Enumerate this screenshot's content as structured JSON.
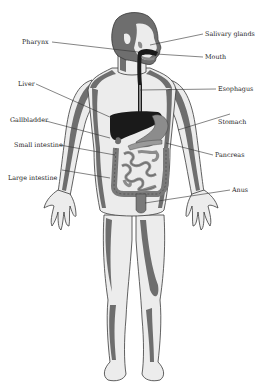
{
  "diagram": {
    "colors": {
      "background": "#ffffff",
      "skin_light": "#ececec",
      "skin_shade": "#6e6e6e",
      "outline": "#3a3a3a",
      "organ_dark": "#1a1a1a",
      "organ_gray": "#8c8c8c",
      "label_text": "#222222"
    },
    "labels": [
      {
        "id": "pharynx",
        "text": "Pharynx",
        "x": 22,
        "y": 44,
        "anchor": "start",
        "line": [
          52,
          42,
          138,
          52
        ]
      },
      {
        "id": "salivary-glands",
        "text": "Salivary glands",
        "x": 205,
        "y": 36,
        "anchor": "start",
        "line": [
          150,
          45,
          203,
          34
        ]
      },
      {
        "id": "mouth",
        "text": "Mouth",
        "x": 205,
        "y": 59,
        "anchor": "start",
        "line": [
          156,
          54,
          203,
          57
        ]
      },
      {
        "id": "liver",
        "text": "Liver",
        "x": 18,
        "y": 86,
        "anchor": "start",
        "line": [
          36,
          84,
          112,
          118
        ]
      },
      {
        "id": "esophagus",
        "text": "Esophagus",
        "x": 218,
        "y": 91,
        "anchor": "start",
        "line": [
          140,
          90,
          216,
          89
        ]
      },
      {
        "id": "gallbladder",
        "text": "Gallbladder",
        "x": 10,
        "y": 122,
        "anchor": "start",
        "line": [
          46,
          121,
          110,
          138
        ]
      },
      {
        "id": "stomach",
        "text": "Stomach",
        "x": 218,
        "y": 124,
        "anchor": "start",
        "line": [
          178,
          130,
          230,
          114
        ]
      },
      {
        "id": "small-intestine",
        "text": "Small intestine",
        "x": 14,
        "y": 147,
        "anchor": "start",
        "line": [
          60,
          145,
          115,
          155
        ]
      },
      {
        "id": "pancreas",
        "text": "Pancreas",
        "x": 215,
        "y": 157,
        "anchor": "start",
        "line": [
          166,
          143,
          213,
          155
        ]
      },
      {
        "id": "large-intestine",
        "text": "Large intestine",
        "x": 8,
        "y": 180,
        "anchor": "start",
        "line": [
          62,
          170,
          110,
          178
        ]
      },
      {
        "id": "anus",
        "text": "Anus",
        "x": 232,
        "y": 192,
        "anchor": "start",
        "line": [
          145,
          203,
          230,
          190
        ]
      }
    ]
  }
}
